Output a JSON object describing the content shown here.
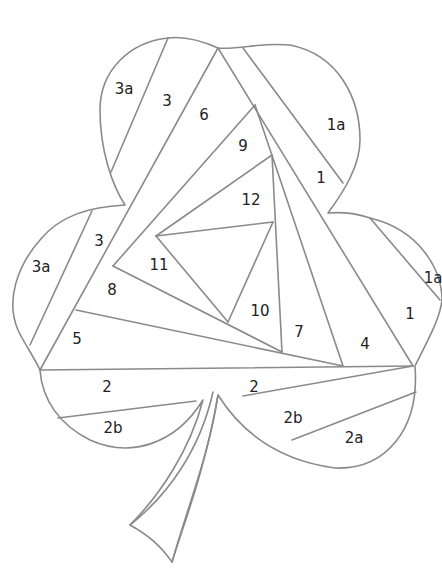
{
  "diagram": {
    "line_color": "#8a8a8a",
    "label_color": "#222222",
    "background": "#ffffff",
    "labels": [
      {
        "id": "3a-top",
        "text": "3a",
        "x": 124,
        "y": 89
      },
      {
        "id": "3-top",
        "text": "3",
        "x": 167,
        "y": 101
      },
      {
        "id": "6",
        "text": "6",
        "x": 204,
        "y": 115
      },
      {
        "id": "1a-top",
        "text": "1a",
        "x": 336,
        "y": 125
      },
      {
        "id": "9",
        "text": "9",
        "x": 243,
        "y": 146
      },
      {
        "id": "1-top",
        "text": "1",
        "x": 321,
        "y": 178
      },
      {
        "id": "12",
        "text": "12",
        "x": 251,
        "y": 200
      },
      {
        "id": "3-left",
        "text": "3",
        "x": 99,
        "y": 241
      },
      {
        "id": "3a-left",
        "text": "3a",
        "x": 41,
        "y": 267
      },
      {
        "id": "11",
        "text": "11",
        "x": 159,
        "y": 265
      },
      {
        "id": "1a-right",
        "text": "1a",
        "x": 433,
        "y": 278
      },
      {
        "id": "8",
        "text": "8",
        "x": 112,
        "y": 290
      },
      {
        "id": "10",
        "text": "10",
        "x": 260,
        "y": 311
      },
      {
        "id": "1-right",
        "text": "1",
        "x": 410,
        "y": 314
      },
      {
        "id": "7",
        "text": "7",
        "x": 299,
        "y": 332
      },
      {
        "id": "5",
        "text": "5",
        "x": 77,
        "y": 339
      },
      {
        "id": "4",
        "text": "4",
        "x": 365,
        "y": 344
      },
      {
        "id": "2-left",
        "text": "2",
        "x": 107,
        "y": 387
      },
      {
        "id": "2-right",
        "text": "2",
        "x": 254,
        "y": 387
      },
      {
        "id": "2b-left",
        "text": "2b",
        "x": 113,
        "y": 428
      },
      {
        "id": "2b-right",
        "text": "2b",
        "x": 293,
        "y": 418
      },
      {
        "id": "2a",
        "text": "2a",
        "x": 354,
        "y": 438
      }
    ]
  }
}
